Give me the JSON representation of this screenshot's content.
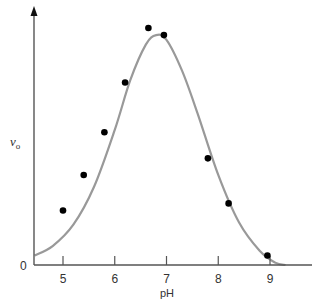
{
  "chart_data": {
    "type": "scatter",
    "title": "",
    "xlabel": "pH",
    "ylabel": "v₀",
    "ylabel_main": "v",
    "ylabel_sub": "o",
    "y_zero_label": "0",
    "xlim": [
      4.45,
      9.75
    ],
    "ylim": [
      0,
      1.1
    ],
    "x_ticks": [
      5,
      6,
      7,
      8,
      9
    ],
    "x_tick_labels": [
      "5",
      "6",
      "7",
      "8",
      "9"
    ],
    "grid": false,
    "legend": null,
    "series": [
      {
        "name": "measured",
        "kind": "points",
        "color": "#000000",
        "x": [
          5.0,
          5.4,
          5.8,
          6.2,
          6.65,
          6.95,
          7.8,
          8.2,
          8.95
        ],
        "y": [
          0.23,
          0.38,
          0.56,
          0.77,
          1.0,
          0.97,
          0.45,
          0.26,
          0.04
        ]
      },
      {
        "name": "fitted curve",
        "kind": "line",
        "color": "#999999",
        "x": [
          4.45,
          4.8,
          5.2,
          5.6,
          6.0,
          6.3,
          6.6,
          6.8,
          7.0,
          7.3,
          7.6,
          8.0,
          8.4,
          8.8,
          9.1,
          9.3
        ],
        "y": [
          0.04,
          0.08,
          0.17,
          0.33,
          0.57,
          0.78,
          0.93,
          0.97,
          0.95,
          0.82,
          0.64,
          0.38,
          0.18,
          0.06,
          0.01,
          0.0
        ]
      }
    ]
  }
}
